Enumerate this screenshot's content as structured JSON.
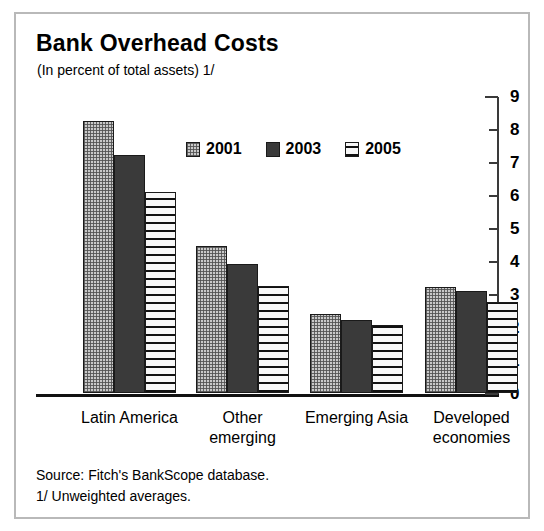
{
  "chart_data": {
    "type": "bar",
    "title": "Bank Overhead Costs",
    "subtitle": "(In percent of total assets) 1/",
    "xlabel": "",
    "ylabel": "",
    "ylim": [
      0,
      9
    ],
    "yticks": [
      0,
      1,
      2,
      3,
      4,
      5,
      6,
      7,
      8,
      9
    ],
    "ytick_labels": [
      "0",
      "1",
      "2",
      "3",
      "4",
      "5",
      "6",
      "7",
      "8",
      "9"
    ],
    "grid": false,
    "axis_position": "right",
    "legend_position": "upper-center",
    "categories": [
      "Latin America",
      "Other emerging",
      "Emerging Asia",
      "Developed economies"
    ],
    "series": [
      {
        "name": "2001",
        "pattern": "dotted-stipple",
        "color": "#c9c9c9",
        "values": [
          8.25,
          4.45,
          2.4,
          3.2
        ]
      },
      {
        "name": "2003",
        "pattern": "solid-dark",
        "color": "#3a3a3a",
        "values": [
          7.2,
          3.9,
          2.2,
          3.1
        ]
      },
      {
        "name": "2005",
        "pattern": "horizontal-lines",
        "color": "#f2f2f2",
        "values": [
          6.1,
          3.25,
          2.05,
          2.75
        ]
      }
    ],
    "notes": [
      "Source: Fitch's BankScope database.",
      "1/ Unweighted averages."
    ]
  },
  "labels": {
    "cat0": "Latin America",
    "cat1": "Other\nemerging",
    "cat2": "Emerging Asia",
    "cat3": "Developed\neconomies"
  }
}
